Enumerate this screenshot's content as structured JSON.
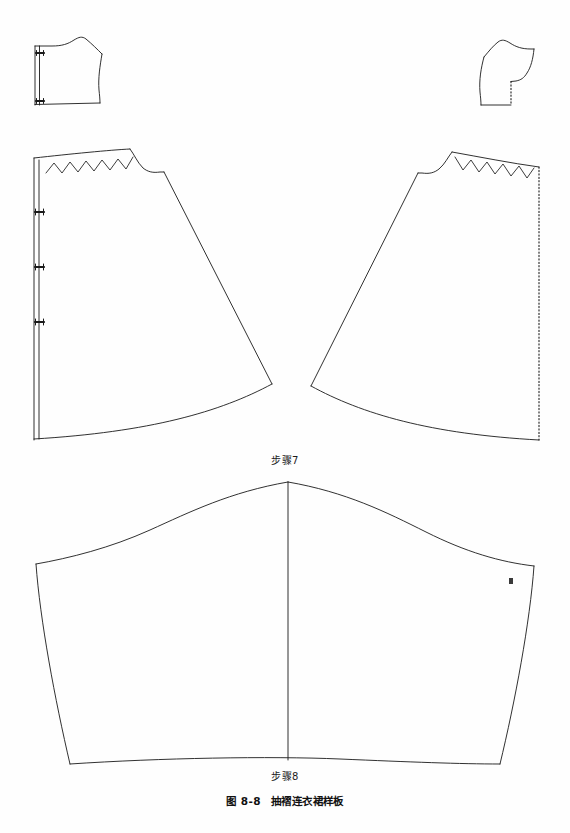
{
  "document": {
    "type": "sewing-pattern-technical-drawing",
    "page_background": "#ffffff",
    "line_color": "#1a1a1a"
  },
  "captions": {
    "step7": "步骤7",
    "step8": "步骤8",
    "figure_number": "图 8-8",
    "figure_title": "抽褶连衣裙样板"
  },
  "pattern_pieces": [
    {
      "id": "bodice-back-left",
      "name": "small-bodice-left",
      "label": "",
      "notch_count": 2,
      "fold_edge": "left",
      "edge_style": "solid"
    },
    {
      "id": "bodice-front-right",
      "name": "small-bodice-right",
      "label": "",
      "notch_count": 0,
      "fold_edge": "right",
      "edge_style": "dotted"
    },
    {
      "id": "skirt-left",
      "name": "gathered-skirt-panel-left",
      "label": "",
      "notch_count": 3,
      "fold_edge": "left",
      "edge_style": "solid",
      "gather_marks": "zigzag",
      "zigzag_peaks": 7
    },
    {
      "id": "skirt-right",
      "name": "gathered-skirt-panel-right",
      "label": "",
      "notch_count": 0,
      "fold_edge": "right",
      "edge_style": "dotted",
      "gather_marks": "zigzag",
      "zigzag_peaks": 7
    },
    {
      "id": "sleeve",
      "name": "sleeve-pattern",
      "label": "前",
      "notch_count": 0,
      "center_line": true,
      "edge_style": "solid"
    }
  ],
  "annotations": {
    "sleeve_front_mark": "前"
  }
}
